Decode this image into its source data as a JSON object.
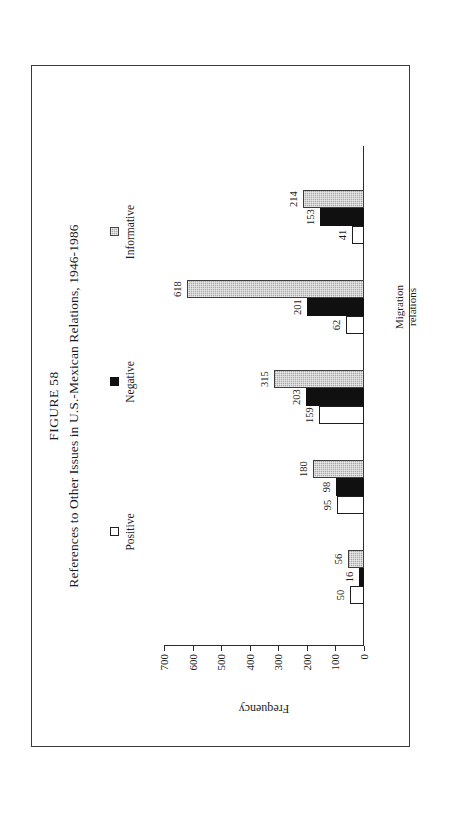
{
  "figure": {
    "number": "FIGURE 58",
    "title": "References to Other Issues in U.S.-Mexican Relations, 1946-1986"
  },
  "legend": {
    "items": [
      {
        "label": "Positive",
        "swatch": "open-square-icon",
        "color": "#ffffff"
      },
      {
        "label": "Negative",
        "swatch": "filled-square-icon",
        "color": "#101010"
      },
      {
        "label": "Informative",
        "swatch": "hatched-square-icon",
        "color": "#a9a9a9"
      }
    ]
  },
  "chart_data": {
    "type": "bar",
    "title": "References to Other Issues in U.S.-Mexican Relations, 1946-1986",
    "xlabel": "",
    "ylabel": "Frequency",
    "ylim": [
      0,
      700
    ],
    "yticks": [
      0,
      100,
      200,
      300,
      400,
      500,
      600,
      700
    ],
    "grid": false,
    "legend_position": "top",
    "orientation": "vertical-bars-on-rotated-page",
    "categories": [
      "Military\nrelations",
      "Energy\nrelations",
      "Border\nrelations",
      "Migration\nrelations",
      "Drug\ntrafficking"
    ],
    "category_lines": [
      [
        "Military",
        "relations"
      ],
      [
        "Energy",
        "relations"
      ],
      [
        "Border",
        "relations"
      ],
      [
        "Migration",
        "relations"
      ],
      [
        "Drug",
        "trafficking"
      ]
    ],
    "series": [
      {
        "name": "Positive",
        "values": [
          50,
          95,
          159,
          62,
          41
        ]
      },
      {
        "name": "Negative",
        "values": [
          16,
          98,
          203,
          201,
          153
        ]
      },
      {
        "name": "Informative",
        "values": [
          56,
          180,
          315,
          618,
          214
        ]
      }
    ]
  }
}
